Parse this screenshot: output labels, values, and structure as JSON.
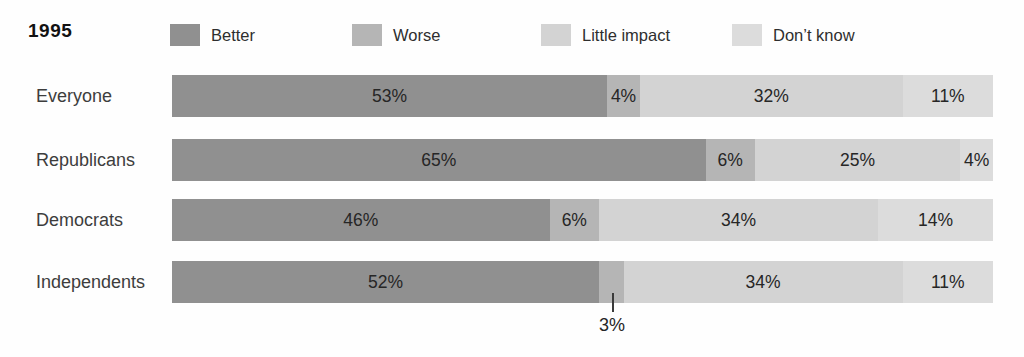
{
  "legend": {
    "year": "1995",
    "items": [
      {
        "label": "Better",
        "color": "#909090"
      },
      {
        "label": "Worse",
        "color": "#b5b5b5"
      },
      {
        "label": "Little impact",
        "color": "#d3d3d3"
      },
      {
        "label": "Don’t know",
        "color": "#dcdcdc"
      }
    ]
  },
  "chart_data": {
    "type": "bar",
    "stacked": true,
    "orientation": "horizontal",
    "unit": "percent",
    "title": "1995",
    "legend_position": "top",
    "axis": {
      "xlim": [
        0,
        100
      ],
      "grid": false,
      "ticks": "none"
    },
    "categories": [
      "Everyone",
      "Republicans",
      "Democrats",
      "Independents"
    ],
    "series": [
      {
        "name": "Better",
        "color": "#909090",
        "values": [
          53,
          65,
          46,
          52
        ]
      },
      {
        "name": "Worse",
        "color": "#b5b5b5",
        "values": [
          4,
          6,
          6,
          3
        ]
      },
      {
        "name": "Little impact",
        "color": "#d3d3d3",
        "values": [
          32,
          25,
          34,
          34
        ]
      },
      {
        "name": "Don’t know",
        "color": "#dcdcdc",
        "values": [
          11,
          4,
          14,
          11
        ]
      }
    ],
    "rows": [
      {
        "category": "Everyone",
        "segments": [
          {
            "series": "Better",
            "value": 53,
            "label": "53%"
          },
          {
            "series": "Worse",
            "value": 4,
            "label": "4%"
          },
          {
            "series": "Little impact",
            "value": 32,
            "label": "32%"
          },
          {
            "series": "Don’t know",
            "value": 11,
            "label": "11%"
          }
        ]
      },
      {
        "category": "Republicans",
        "segments": [
          {
            "series": "Better",
            "value": 65,
            "label": "65%"
          },
          {
            "series": "Worse",
            "value": 6,
            "label": "6%"
          },
          {
            "series": "Little impact",
            "value": 25,
            "label": "25%"
          },
          {
            "series": "Don’t know",
            "value": 4,
            "label": "4%"
          }
        ]
      },
      {
        "category": "Democrats",
        "segments": [
          {
            "series": "Better",
            "value": 46,
            "label": "46%"
          },
          {
            "series": "Worse",
            "value": 6,
            "label": "6%"
          },
          {
            "series": "Little impact",
            "value": 34,
            "label": "34%"
          },
          {
            "series": "Don’t know",
            "value": 14,
            "label": "14%"
          }
        ]
      },
      {
        "category": "Independents",
        "segments": [
          {
            "series": "Better",
            "value": 52,
            "label": "52%"
          },
          {
            "series": "Worse",
            "value": 3,
            "label": ""
          },
          {
            "series": "Little impact",
            "value": 34,
            "label": "34%"
          },
          {
            "series": "Don’t know",
            "value": 11,
            "label": "11%"
          }
        ]
      }
    ],
    "annotation": {
      "text": "3%",
      "target": "Independents / Worse",
      "position": "below-bar-with-leader-line"
    }
  }
}
